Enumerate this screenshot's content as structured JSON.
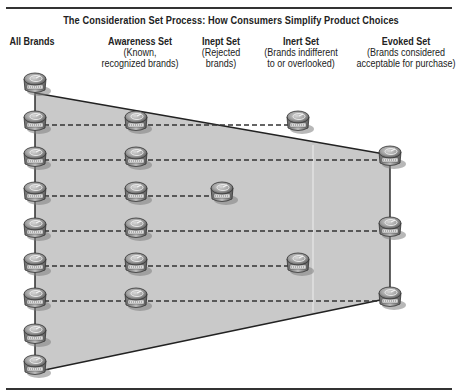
{
  "figure": {
    "caption_partial": "Consideration Set Process",
    "title": "The Consideration Set Process: How Consumers Simplify Product Choices"
  },
  "columns": [
    {
      "id": "all",
      "heading": "All Brands",
      "description": ""
    },
    {
      "id": "awareness",
      "heading": "Awareness Set",
      "description": "(Known, recognized brands)"
    },
    {
      "id": "inept",
      "heading": "Inept Set",
      "description": "(Rejected brands)"
    },
    {
      "id": "inert",
      "heading": "Inert Set",
      "description": "(Brands indifferent to or overlooked)"
    },
    {
      "id": "evoked",
      "heading": "Evoked Set",
      "description": "(Brands considered acceptable for purchase)"
    }
  ],
  "brand_icon": "product-can-icon",
  "brand_counts": {
    "all": 9,
    "awareness": 7,
    "inept": 1,
    "inert": 2,
    "evoked": 3
  },
  "colors": {
    "funnel_fill": "#c9c9c9",
    "funnel_edge": "#222222",
    "rule": "#333333"
  }
}
